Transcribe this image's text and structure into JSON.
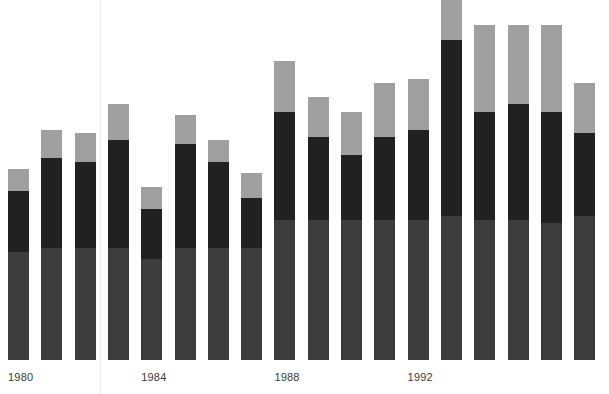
{
  "chart_data": {
    "type": "bar",
    "title": "",
    "subtitle": "",
    "xlabel": "",
    "ylabel": "",
    "stacked": true,
    "grid": false,
    "legend_position": "none",
    "axis_ranges": {
      "ylim": [
        0,
        100
      ]
    },
    "colors": {
      "bottom": "#3c3c3c",
      "middle": "#212121",
      "top": "#a0a0a0",
      "background": "#ffffff",
      "label_text": "#3a3a3a"
    },
    "categories": [
      "1980",
      "1981",
      "1982",
      "1983",
      "1984",
      "1985",
      "1986",
      "1987",
      "1988",
      "1989",
      "1990",
      "1991",
      "1992",
      "1993",
      "1994",
      "1995",
      "1996",
      "1997"
    ],
    "tick_labels": [
      "1980",
      "1984",
      "1988",
      "1992"
    ],
    "tick_label_indices": [
      0,
      4,
      8,
      12
    ],
    "series": [
      {
        "name": "bottom",
        "color": "#3c3c3c",
        "values": [
          30,
          31,
          31,
          31,
          28,
          31,
          31,
          31,
          39,
          39,
          39,
          39,
          39,
          40,
          39,
          39,
          38,
          40
        ]
      },
      {
        "name": "middle",
        "color": "#212121",
        "values": [
          17,
          25,
          24,
          30,
          14,
          29,
          24,
          14,
          30,
          23,
          18,
          23,
          25,
          49,
          30,
          32,
          31,
          23
        ]
      },
      {
        "name": "top",
        "color": "#a0a0a0",
        "values": [
          6,
          8,
          8,
          10,
          6,
          8,
          6,
          7,
          14,
          11,
          12,
          15,
          14,
          13,
          24,
          22,
          24,
          14
        ]
      }
    ],
    "totals": [
      53,
      64,
      63,
      71,
      48,
      68,
      61,
      52,
      83,
      73,
      69,
      77,
      78,
      102,
      93,
      93,
      93,
      77
    ]
  },
  "layout": {
    "bar_width_px": 21,
    "bar_pitch_px": 33.3,
    "first_bar_x_px": 8,
    "baseline_y_px": 360,
    "value_scale_px_per_unit": 3.6,
    "scan_artifact_x_px": 100
  }
}
